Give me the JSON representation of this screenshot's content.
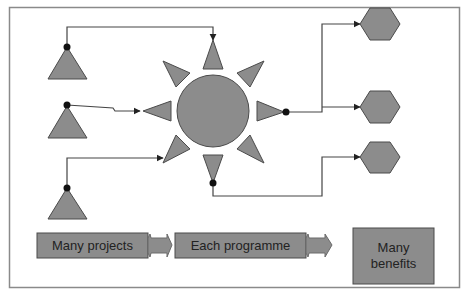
{
  "colors": {
    "shape_fill": "#8c8c8c",
    "shape_stroke": "#4a4a4a",
    "line": "#444444",
    "frame": "#8a8a8a",
    "background": "#ffffff"
  },
  "diagram": {
    "sources": [
      {
        "id": "project-1",
        "shape": "triangle"
      },
      {
        "id": "project-2",
        "shape": "triangle"
      },
      {
        "id": "project-3",
        "shape": "triangle"
      }
    ],
    "hub": {
      "id": "programme-sun",
      "shape": "circle-with-8-rays"
    },
    "outputs": [
      {
        "id": "benefit-1",
        "shape": "hexagon"
      },
      {
        "id": "benefit-2",
        "shape": "hexagon"
      },
      {
        "id": "benefit-3",
        "shape": "hexagon"
      }
    ],
    "flow": [
      {
        "label": "Many projects"
      },
      {
        "label": "Each programme"
      },
      {
        "label": "Many benefits"
      }
    ]
  }
}
